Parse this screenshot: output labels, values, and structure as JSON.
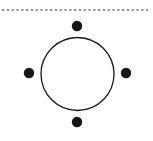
{
  "figure": {
    "name": "circle-with-four-cardinal-points",
    "width": 153,
    "height": 141,
    "background_color": "#ffffff",
    "stroke_color": "#1a1a1a",
    "fill_color": "#1a1a1a",
    "alt_text": "A thin circle outline with four small filled dots placed at its top, bottom, left and right, beneath a horizontal dashed line"
  },
  "dashed_line": {
    "label": "horizontal dashed guide line",
    "color": "#2b2b2b",
    "y": 10,
    "x_start": 2,
    "x_end": 151,
    "stroke_width": 1.2,
    "dash_length": 2.2,
    "gap_length": 2.6
  },
  "circle": {
    "label": "main circle outline",
    "center_x": 77.5,
    "center_y": 74,
    "radius": 36.5,
    "stroke_width": 1.3,
    "stroke_color": "#1a1a1a",
    "fill": "none"
  },
  "points": [
    {
      "name": "top-point",
      "label": "top",
      "cx": 77,
      "cy": 26,
      "r": 5.2,
      "color": "#161616"
    },
    {
      "name": "right-point",
      "label": "right",
      "cx": 126,
      "cy": 73,
      "r": 5.2,
      "color": "#161616"
    },
    {
      "name": "bottom-point",
      "label": "bottom",
      "cx": 77,
      "cy": 122,
      "r": 5.2,
      "color": "#161616"
    },
    {
      "name": "left-point",
      "label": "left",
      "cx": 29,
      "cy": 73,
      "r": 5.2,
      "color": "#161616"
    }
  ]
}
